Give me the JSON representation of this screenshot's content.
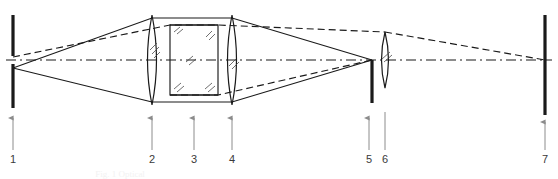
{
  "figure": {
    "caption_faint": "Fig. 1  Optical",
    "background_color": "#ffffff",
    "ink_color": "#1a1a1a",
    "label_color": "#3a3a3a",
    "leader_color": "#8c8c8c",
    "axis": {
      "y": 60,
      "x_start": 6,
      "x_end": 552,
      "style": "dashed",
      "label": "optical-axis"
    },
    "labels": [
      {
        "id": "1",
        "text": "1",
        "x": 13,
        "y": 160,
        "leader_from_y": 150,
        "leader_to_y": 118,
        "component": "object-plane"
      },
      {
        "id": "2",
        "text": "2",
        "x": 152,
        "y": 160,
        "leader_from_y": 150,
        "leader_to_y": 118,
        "component": "front-objective-lens"
      },
      {
        "id": "3",
        "text": "3",
        "x": 194,
        "y": 160,
        "leader_from_y": 150,
        "leader_to_y": 118,
        "component": "plane-parallel-plate"
      },
      {
        "id": "4",
        "text": "4",
        "x": 232,
        "y": 160,
        "leader_from_y": 150,
        "leader_to_y": 118,
        "component": "rear-objective-lens"
      },
      {
        "id": "5",
        "text": "5",
        "x": 369,
        "y": 160,
        "leader_from_y": 150,
        "leader_to_y": 118,
        "component": "field-stop"
      },
      {
        "id": "6",
        "text": "6",
        "x": 385,
        "y": 160,
        "leader_from_y": 150,
        "leader_to_y": 118,
        "component": "eyepiece-lens"
      },
      {
        "id": "7",
        "text": "7",
        "x": 545,
        "y": 160,
        "leader_from_y": 150,
        "leader_to_y": 118,
        "component": "image-plane"
      }
    ],
    "components": [
      {
        "name": "object-plane-bar",
        "type": "bar",
        "x": 13,
        "y_top": 15,
        "y_bottom": 108,
        "gap_top": 56,
        "gap_bottom": 64,
        "width": 3
      },
      {
        "name": "front-objective-lens",
        "type": "biconvex-lens",
        "cx": 152,
        "cy": 60,
        "half_height": 45,
        "half_width": 7
      },
      {
        "name": "plane-parallel-plate",
        "type": "rectangle",
        "x_left": 170,
        "x_right": 218,
        "y_top": 25,
        "y_bottom": 95
      },
      {
        "name": "rear-objective-lens",
        "type": "biconvex-lens",
        "cx": 232,
        "cy": 60,
        "half_height": 45,
        "half_width": 7
      },
      {
        "name": "field-stop-bar",
        "type": "bar",
        "x": 372,
        "y_top": 60,
        "y_bottom": 103,
        "width": 3
      },
      {
        "name": "eyepiece-lens",
        "type": "biconvex-lens",
        "cx": 385,
        "cy": 60,
        "half_height": 28,
        "half_width": 6
      },
      {
        "name": "image-plane-bar",
        "type": "bar",
        "x": 545,
        "y_top": 15,
        "y_bottom": 115,
        "width": 3
      }
    ],
    "rays": {
      "marginal_solid": [
        {
          "name": "upper-marginal-ray",
          "points": "13,68 152,18 232,18 372,60"
        },
        {
          "name": "lower-marginal-ray",
          "points": "13,68 152,102 232,102 372,60"
        }
      ],
      "chief_dashed": [
        {
          "name": "upper-chief-ray",
          "points": "13,57 170,25 218,25 385,32"
        },
        {
          "name": "lower-chief-ray",
          "points": "170,95 218,95 372,60"
        },
        {
          "name": "eyepiece-to-image-ray",
          "points": "385,32 545,60"
        }
      ]
    },
    "hatch_marks": {
      "name": "glass-hatching",
      "note": "short double/triple diagonal strokes marking glass elements",
      "count": 11
    }
  }
}
